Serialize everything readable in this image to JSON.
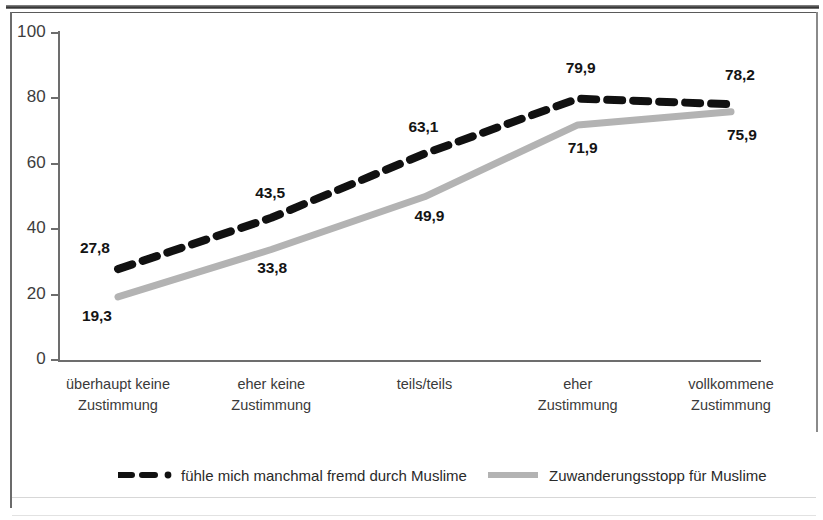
{
  "chart_data": {
    "type": "line",
    "title": "",
    "subtitle": "",
    "xlabel": "",
    "ylabel": "",
    "ylim": [
      0,
      100
    ],
    "yticks": [
      "0",
      "20",
      "40",
      "60",
      "80",
      "100"
    ],
    "grid": false,
    "legend_position": "bottom",
    "categories": [
      "überhaupt keine Zustimmung",
      "eher keine Zustimmung",
      "teils/teils",
      "eher Zustimmung",
      "vollkommene Zustimmung"
    ],
    "category_lines": [
      [
        "überhaupt keine",
        "Zustimmung"
      ],
      [
        "eher keine",
        "Zustimmung"
      ],
      [
        "teils/teils",
        ""
      ],
      [
        "eher",
        "Zustimmung"
      ],
      [
        "vollkommene",
        "Zustimmung"
      ]
    ],
    "series": [
      {
        "name": "fühle mich manchmal fremd durch Muslime",
        "color": "#111111",
        "style": "dashed",
        "values": [
          27.8,
          43.5,
          63.1,
          79.9,
          78.2
        ],
        "labels": [
          "27,8",
          "43,5",
          "63,1",
          "79,9",
          "78,2"
        ]
      },
      {
        "name": "Zuwanderungsstopp für Muslime",
        "color": "#b3b3b3",
        "style": "solid",
        "values": [
          19.3,
          33.8,
          49.9,
          71.9,
          75.9
        ],
        "labels": [
          "19,3",
          "33,8",
          "49,9",
          "71,9",
          "75,9"
        ]
      }
    ]
  },
  "legend": {
    "items": [
      {
        "label": "fühle mich manchmal fremd durch Muslime",
        "marker": "dashed-line-with-dot",
        "color": "#111111"
      },
      {
        "label": "Zuwanderungsstopp für Muslime",
        "marker": "solid-line",
        "color": "#b3b3b3"
      }
    ]
  },
  "axis": {
    "y_ticks": [
      "100",
      "80",
      "60",
      "40",
      "20",
      "0"
    ]
  }
}
